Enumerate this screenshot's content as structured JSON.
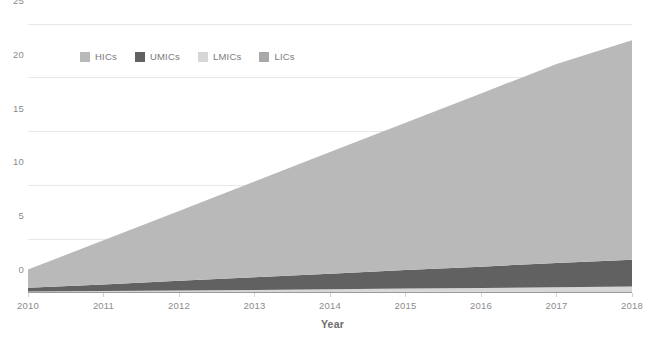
{
  "chart_data": {
    "type": "area",
    "stacked": true,
    "title": "",
    "xlabel": "Year",
    "ylabel": "",
    "x": [
      2010,
      2011,
      2012,
      2013,
      2014,
      2015,
      2016,
      2017,
      2018
    ],
    "categories": [
      "2010",
      "2011",
      "2012",
      "2013",
      "2014",
      "2015",
      "2016",
      "2017",
      "2018"
    ],
    "xlim": [
      2010,
      2018
    ],
    "ylim": [
      0,
      25
    ],
    "yticks": [
      0,
      5,
      10,
      15,
      20,
      25
    ],
    "ytick_labels": [
      "0",
      "5",
      "10",
      "15",
      "20",
      "25"
    ],
    "xticks": [
      2010,
      2011,
      2012,
      2013,
      2014,
      2015,
      2016,
      2017,
      2018
    ],
    "grid": true,
    "grid_axis": "y",
    "legend_position": "top-left-inside",
    "series": [
      {
        "name": "LICs",
        "color": "#a8a8a8",
        "values": [
          0.05,
          0.06,
          0.07,
          0.08,
          0.1,
          0.11,
          0.12,
          0.13,
          0.15
        ]
      },
      {
        "name": "LMICs",
        "color": "#d6d6d6",
        "values": [
          0.08,
          0.12,
          0.16,
          0.2,
          0.25,
          0.3,
          0.35,
          0.4,
          0.45
        ]
      },
      {
        "name": "UMICs",
        "color": "#616161",
        "values": [
          0.35,
          0.62,
          0.9,
          1.18,
          1.45,
          1.72,
          1.98,
          2.25,
          2.5
        ]
      },
      {
        "name": "HICs",
        "color": "#b9b9b9",
        "values": [
          1.7,
          4.1,
          6.5,
          8.9,
          11.3,
          13.7,
          16.1,
          18.5,
          20.4
        ]
      }
    ],
    "stack_order": [
      "LICs",
      "LMICs",
      "UMICs",
      "HICs"
    ],
    "totals": [
      2.18,
      4.9,
      7.63,
      10.36,
      13.1,
      15.83,
      18.55,
      21.28,
      23.5
    ],
    "axis_color": "#9a9a9a",
    "grid_color": "#e8e8e8",
    "tick_text_color": "#8c8c8c",
    "axis_title_color": "#6d6d6d"
  },
  "legend": {
    "items": [
      {
        "label": "HICs",
        "color": "#b9b9b9"
      },
      {
        "label": "UMICs",
        "color": "#616161"
      },
      {
        "label": "LMICs",
        "color": "#d6d6d6"
      },
      {
        "label": "LICs",
        "color": "#a8a8a8"
      }
    ]
  },
  "axes": {
    "x_title": "Year",
    "y_tick_labels": [
      "25",
      "20",
      "15",
      "10",
      "5",
      "0"
    ],
    "x_tick_labels": [
      "2010",
      "2011",
      "2012",
      "2013",
      "2014",
      "2015",
      "2016",
      "2017",
      "2018"
    ]
  }
}
